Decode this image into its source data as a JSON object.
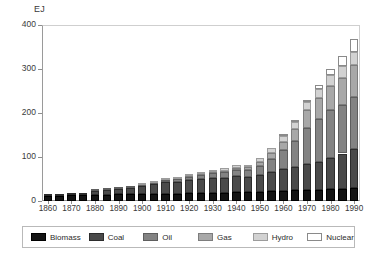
{
  "chart_data": {
    "type": "bar",
    "subtype": "stacked",
    "title": "",
    "xlabel": "",
    "ylabel": "EJ",
    "unit_label": "EJ",
    "ylim": [
      0,
      400
    ],
    "yticks": [
      0,
      100,
      200,
      300,
      400
    ],
    "ytick_labels": [
      "0",
      "100",
      "200",
      "300",
      "400"
    ],
    "grid": false,
    "legend_position": "bottom",
    "x": [
      1860,
      1865,
      1870,
      1875,
      1880,
      1885,
      1890,
      1895,
      1900,
      1905,
      1910,
      1915,
      1920,
      1925,
      1930,
      1935,
      1940,
      1945,
      1950,
      1955,
      1960,
      1965,
      1970,
      1975,
      1980,
      1985,
      1990
    ],
    "categories": [
      "1860",
      "1865",
      "1870",
      "1875",
      "1880",
      "1885",
      "1890",
      "1895",
      "1900",
      "1905",
      "1910",
      "1915",
      "1920",
      "1925",
      "1930",
      "1935",
      "1940",
      "1945",
      "1950",
      "1955",
      "1960",
      "1965",
      "1970",
      "1975",
      "1980",
      "1985",
      "1990"
    ],
    "xtick_labels": [
      "1860",
      "1870",
      "1880",
      "1890",
      "1900",
      "1910",
      "1920",
      "1930",
      "1940",
      "1950",
      "1960",
      "1970",
      "1980",
      "1990"
    ],
    "xticks": [
      1860,
      1870,
      1880,
      1890,
      1900,
      1910,
      1920,
      1930,
      1940,
      1950,
      1960,
      1970,
      1980,
      1990
    ],
    "series": [
      {
        "name": "Biomass",
        "color": "#141414",
        "values": [
          12,
          12,
          13,
          13,
          14,
          14,
          15,
          15,
          16,
          16,
          17,
          17,
          18,
          18,
          19,
          19,
          20,
          20,
          21,
          22,
          23,
          24,
          25,
          26,
          27,
          28,
          29
        ]
      },
      {
        "name": "Coal",
        "color": "#4a4a4a",
        "values": [
          3,
          4,
          5,
          6,
          8,
          10,
          12,
          15,
          18,
          22,
          26,
          27,
          30,
          32,
          33,
          33,
          36,
          35,
          38,
          44,
          50,
          54,
          58,
          62,
          70,
          80,
          90
        ]
      },
      {
        "name": "Oil",
        "color": "#838383",
        "values": [
          0,
          0,
          0,
          0,
          1,
          1,
          1,
          2,
          2,
          3,
          4,
          5,
          7,
          9,
          11,
          13,
          15,
          16,
          21,
          30,
          42,
          58,
          84,
          98,
          110,
          110,
          118
        ]
      },
      {
        "name": "Gas",
        "color": "#a8a8a8",
        "values": [
          0,
          0,
          0,
          0,
          0,
          0,
          0,
          0,
          0,
          0,
          1,
          1,
          2,
          2,
          3,
          4,
          5,
          6,
          9,
          14,
          20,
          28,
          40,
          48,
          55,
          62,
          72
        ]
      },
      {
        "name": "Hydro",
        "color": "#d2d2d2",
        "values": [
          0,
          0,
          0,
          0,
          0,
          0,
          0,
          0,
          1,
          1,
          1,
          2,
          2,
          3,
          4,
          5,
          6,
          6,
          8,
          10,
          12,
          15,
          18,
          21,
          24,
          27,
          30
        ]
      },
      {
        "name": "Nuclear",
        "color": "#ffffff",
        "values": [
          0,
          0,
          0,
          0,
          0,
          0,
          0,
          0,
          0,
          0,
          0,
          0,
          0,
          0,
          0,
          0,
          0,
          0,
          0,
          0,
          1,
          2,
          4,
          8,
          14,
          22,
          30
        ]
      }
    ],
    "totals": [
      15,
      16,
      18,
      19,
      23,
      25,
      28,
      32,
      37,
      42,
      49,
      52,
      59,
      64,
      70,
      74,
      82,
      83,
      97,
      120,
      148,
      181,
      229,
      263,
      300,
      329,
      369
    ]
  },
  "legend": {
    "items": [
      {
        "label": "Biomass",
        "color": "#141414"
      },
      {
        "label": "Coal",
        "color": "#4a4a4a"
      },
      {
        "label": "Oil",
        "color": "#838383"
      },
      {
        "label": "Gas",
        "color": "#a8a8a8"
      },
      {
        "label": "Hydro",
        "color": "#d2d2d2"
      },
      {
        "label": "Nuclear",
        "color": "#ffffff"
      }
    ]
  },
  "caption": ""
}
